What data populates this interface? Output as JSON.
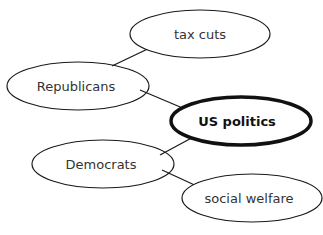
{
  "diagram": {
    "type": "concept-map",
    "nodes": [
      {
        "id": "tax_cuts",
        "label": "tax cuts"
      },
      {
        "id": "republicans",
        "label": "Republicans"
      },
      {
        "id": "us_politics",
        "label": "US politics",
        "emphasis": "bold"
      },
      {
        "id": "democrats",
        "label": "Democrats"
      },
      {
        "id": "social_welfare",
        "label": "social welfare"
      }
    ],
    "edges": [
      {
        "from": "republicans",
        "to": "tax_cuts"
      },
      {
        "from": "republicans",
        "to": "us_politics"
      },
      {
        "from": "democrats",
        "to": "us_politics"
      },
      {
        "from": "democrats",
        "to": "social_welfare"
      }
    ],
    "colors": {
      "stroke": "#1a1a1a",
      "text": "#333333",
      "background": "#ffffff"
    }
  }
}
